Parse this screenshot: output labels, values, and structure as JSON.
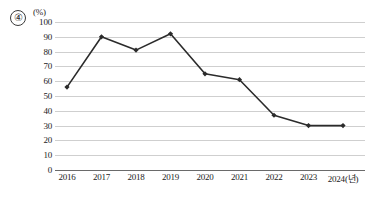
{
  "figure": {
    "index_label": "④",
    "unit_label": "(%)"
  },
  "chart_data": {
    "type": "line",
    "title": "",
    "xlabel": "",
    "ylabel": "(%)",
    "x_unit_suffix": "(년)",
    "categories": [
      "2016",
      "2017",
      "2018",
      "2019",
      "2020",
      "2021",
      "2022",
      "2023",
      "2024(년)"
    ],
    "x": [
      2016,
      2017,
      2018,
      2019,
      2020,
      2021,
      2022,
      2023,
      2024
    ],
    "values": [
      56,
      90,
      81,
      92,
      65,
      61,
      37,
      30,
      30
    ],
    "series": [
      {
        "name": "",
        "values": [
          56,
          90,
          81,
          92,
          65,
          61,
          37,
          30,
          30
        ]
      }
    ],
    "ylim": [
      0,
      100
    ],
    "yticks": [
      100,
      90,
      80,
      70,
      60,
      50,
      40,
      30,
      20,
      10,
      0
    ],
    "ytick_labels": [
      "100",
      "90",
      "80",
      "70",
      "60",
      "50",
      "40",
      "30",
      "20",
      "10",
      "0"
    ],
    "grid": true,
    "grid_axis": "y",
    "legend": false,
    "legend_position": "none",
    "marker": "diamond",
    "line_color": "#2b2b2b",
    "grid_color": "#cfcfcf",
    "axis_color": "#6a6a6a"
  }
}
